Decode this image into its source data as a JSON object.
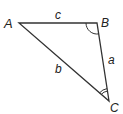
{
  "diagram": {
    "type": "triangle",
    "stroke_color": "#333333",
    "vertices": [
      {
        "label": "A",
        "x": 19,
        "y": 23
      },
      {
        "label": "B",
        "x": 97,
        "y": 23
      },
      {
        "label": "C",
        "x": 109,
        "y": 101
      }
    ],
    "sides": [
      {
        "label": "c",
        "from": "A",
        "to": "B"
      },
      {
        "label": "a",
        "from": "B",
        "to": "C"
      },
      {
        "label": "b",
        "from": "A",
        "to": "C"
      }
    ],
    "angle_marks": [
      {
        "vertex": "B",
        "arcs": 1
      },
      {
        "vertex": "C",
        "arcs": 2
      }
    ]
  }
}
